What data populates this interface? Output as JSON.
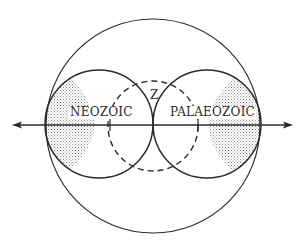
{
  "diagram": {
    "labels": {
      "left": "NEOZOIC",
      "right": "PALAEOZOIC",
      "center": "Z"
    },
    "colors": {
      "line": "#2b2b2b",
      "stipple": "#9a9a9a",
      "background": "#ffffff"
    },
    "shapes": {
      "outer_circle": {
        "cx": 153,
        "cy": 126,
        "r": 107
      },
      "left_circle": {
        "cx": 99,
        "cy": 124,
        "r": 54
      },
      "right_circle": {
        "cx": 207,
        "cy": 124,
        "r": 54
      },
      "dashed_circle": {
        "cx": 153,
        "cy": 126,
        "r": 45
      },
      "axis": {
        "y": 125,
        "x1": 12,
        "x2": 293,
        "direction": "bidirectional"
      },
      "tick_marks_x": [
        110,
        198
      ]
    }
  }
}
